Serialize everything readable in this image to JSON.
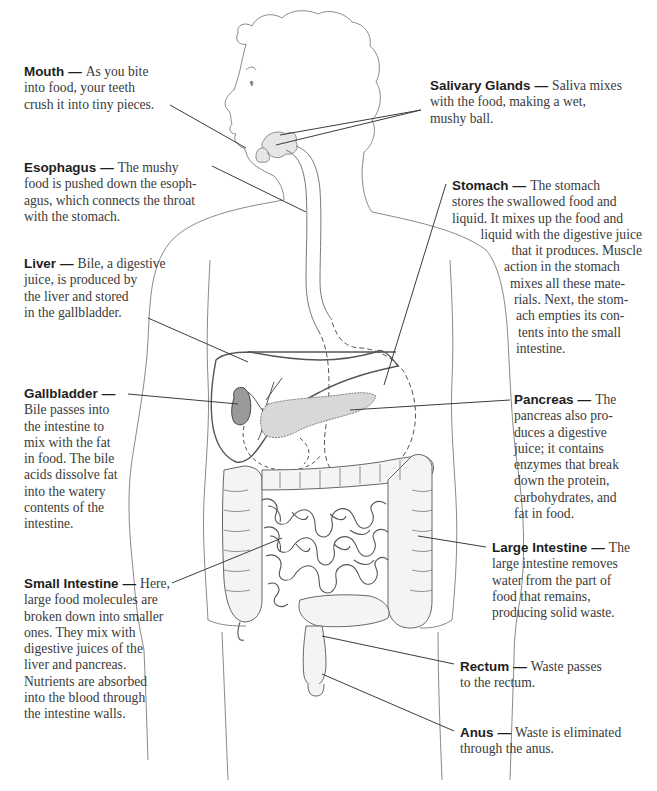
{
  "diagram": {
    "style": {
      "text_color": "#3a3a3a",
      "term_color": "#1e1e1e",
      "line_color": "#3c3c3c",
      "outline_color": "#8a8a8a",
      "background": "#ffffff"
    },
    "labels": {
      "mouth": {
        "term": "Mouth",
        "dash": "—",
        "lines": [
          "As you bite",
          "into food, your teeth",
          "crush it into tiny pieces."
        ]
      },
      "salivary_glands": {
        "term": "Salivary Glands",
        "dash": "—",
        "lines": [
          "Saliva mixes",
          "with the food, making a wet,",
          "mushy ball."
        ]
      },
      "esophagus": {
        "term": "Esophagus",
        "dash": "—",
        "lines": [
          "The mushy",
          "food is pushed down the esoph-",
          "agus, which connects the throat",
          "with the stomach."
        ]
      },
      "stomach": {
        "term": "Stomach",
        "dash": "—",
        "lines": [
          "The stomach",
          "stores the swallowed food and",
          "liquid. It mixes up the food and",
          "liquid with the digestive juice",
          "that it produces. Muscle",
          "action in the stomach",
          "mixes all these mate-",
          "rials. Next, the stom-",
          "ach empties its con-",
          "tents into the small",
          "intestine."
        ]
      },
      "liver": {
        "term": "Liver",
        "dash": "—",
        "lines": [
          "Bile, a digestive",
          "juice, is produced by",
          "the liver and stored",
          "in the gallbladder."
        ]
      },
      "gallbladder": {
        "term": "Gallbladder",
        "dash": "—",
        "lines": [
          "Bile passes into",
          "the intestine to",
          "mix with the fat",
          "in food. The bile",
          "acids dissolve fat",
          "into the watery",
          "contents of the",
          "intestine."
        ]
      },
      "pancreas": {
        "term": "Pancreas",
        "dash": "—",
        "lines": [
          "The",
          "pancreas also pro-",
          "duces a digestive",
          "juice; it contains",
          "enzymes that break",
          "down the protein,",
          "carbohydrates,  and",
          "fat in food."
        ]
      },
      "large_intestine": {
        "term": "Large Intestine",
        "dash": "—",
        "lines": [
          "The",
          "large intestine removes",
          "water from the part of",
          "food that remains,",
          "producing solid waste."
        ]
      },
      "small_intestine": {
        "term": "Small Intestine",
        "dash": "—",
        "lines": [
          "Here,",
          "large food molecules are",
          "broken down into smaller",
          "ones. They mix with",
          "digestive juices of the",
          "liver and pancreas.",
          "Nutrients are absorbed",
          "into the blood through",
          "the intestine walls."
        ]
      },
      "rectum": {
        "term": "Rectum",
        "dash": "—",
        "lines": [
          "Waste passes",
          "to the rectum."
        ]
      },
      "anus": {
        "term": "Anus",
        "dash": "—",
        "lines": [
          "Waste is eliminated",
          "through the anus."
        ]
      }
    }
  }
}
